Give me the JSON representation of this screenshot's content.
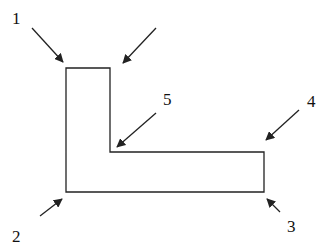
{
  "diagram": {
    "type": "L-shaped outline with labeled arrows",
    "stroke_color": "#222222",
    "shape": {
      "name": "l-shape",
      "points": [
        [
          66,
          68
        ],
        [
          110,
          68
        ],
        [
          110,
          152
        ],
        [
          264,
          152
        ],
        [
          264,
          192
        ],
        [
          66,
          192
        ]
      ]
    },
    "labels": [
      {
        "id": "1",
        "text": "1",
        "x": 12,
        "y": 10
      },
      {
        "id": "2",
        "text": "2",
        "x": 12,
        "y": 228
      },
      {
        "id": "3",
        "text": "3",
        "x": 287,
        "y": 218
      },
      {
        "id": "4",
        "text": "4",
        "x": 307,
        "y": 93
      },
      {
        "id": "5",
        "text": "5",
        "x": 163,
        "y": 91
      }
    ],
    "arrows": [
      {
        "name": "arrow-1",
        "from": [
          32,
          28
        ],
        "to": [
          63,
          62
        ]
      },
      {
        "name": "arrow-top-right",
        "from": [
          156,
          28
        ],
        "to": [
          123,
          63
        ]
      },
      {
        "name": "arrow-5",
        "from": [
          156,
          113
        ],
        "to": [
          117,
          147
        ]
      },
      {
        "name": "arrow-4",
        "from": [
          299,
          110
        ],
        "to": [
          266,
          140
        ]
      },
      {
        "name": "arrow-2",
        "from": [
          40,
          216
        ],
        "to": [
          62,
          199
        ]
      },
      {
        "name": "arrow-3",
        "from": [
          280,
          212
        ],
        "to": [
          267,
          199
        ]
      }
    ]
  }
}
